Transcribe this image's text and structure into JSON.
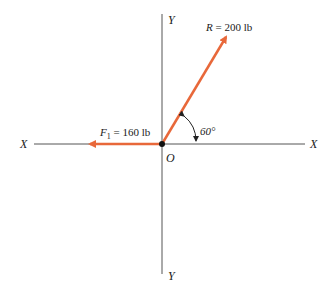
{
  "diagram": {
    "axes": {
      "x_left_label": "X",
      "x_right_label": "X",
      "y_top_label": "Y",
      "y_bottom_label": "Y",
      "origin_label": "O"
    },
    "forces": [
      {
        "name": "F1",
        "label_symbol": "F",
        "label_subscript": "1",
        "label_value": " = 160 lb",
        "direction": "negative x-axis"
      },
      {
        "name": "R",
        "label_symbol": "R",
        "label_value": " = 200 lb",
        "angle_deg": 60
      }
    ],
    "angle_label": "60°",
    "colors": {
      "force": "#e8683a",
      "axis": "#555555",
      "origin": "#111111"
    }
  }
}
